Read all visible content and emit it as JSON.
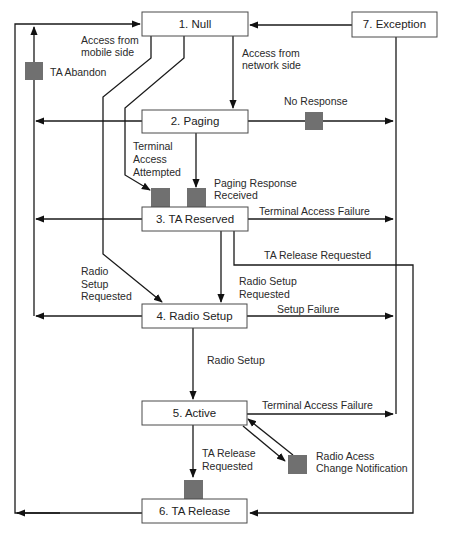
{
  "diagram": {
    "states": [
      {
        "id": "null",
        "label": "1.  Null"
      },
      {
        "id": "paging",
        "label": "2.  Paging"
      },
      {
        "id": "ta-reserved",
        "label": "3.  TA Reserved"
      },
      {
        "id": "radio-setup",
        "label": "4.  Radio Setup"
      },
      {
        "id": "active",
        "label": "5.  Active"
      },
      {
        "id": "ta-release",
        "label": "6.  TA Release"
      },
      {
        "id": "exception",
        "label": "7.  Exception"
      }
    ],
    "labels": {
      "access_mobile_1": "Access from",
      "access_mobile_2": "mobile side",
      "access_network_1": "Access from",
      "access_network_2": "network side",
      "ta_abandon": "TA Abandon",
      "no_response": "No Response",
      "terminal_access_attempted_1": "Terminal",
      "terminal_access_attempted_2": "Access",
      "terminal_access_attempted_3": "Attempted",
      "paging_response_1": "Paging Response",
      "paging_response_2": "Received",
      "terminal_access_failure_3": "Terminal Access Failure",
      "ta_release_requested_3": "TA Release Requested",
      "radio_setup_requested_left_1": "Radio",
      "radio_setup_requested_left_2": "Setup",
      "radio_setup_requested_left_3": "Requested",
      "radio_setup_requested_right_1": "Radio Setup",
      "radio_setup_requested_right_2": "Requested",
      "setup_failure": "Setup Failure",
      "radio_setup": "Radio Setup",
      "terminal_access_failure_5": "Terminal Access Failure",
      "ta_release_requested_5_1": "TA Release",
      "ta_release_requested_5_2": "Requested",
      "radio_access_change_1": "Radio Acess",
      "radio_access_change_2": "Change Notification"
    },
    "colors": {
      "marker": "#707070",
      "line": "#1a1a1a"
    }
  }
}
